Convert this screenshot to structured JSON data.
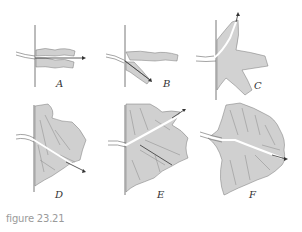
{
  "figure": {
    "caption": "figure 23.21",
    "panels": [
      {
        "id": "A",
        "label": "A"
      },
      {
        "id": "B",
        "label": "B"
      },
      {
        "id": "C",
        "label": "C"
      },
      {
        "id": "D",
        "label": "D"
      },
      {
        "id": "E",
        "label": "E"
      },
      {
        "id": "F",
        "label": "F"
      }
    ],
    "colors": {
      "fill": "#d4d4d4",
      "line": "#555555",
      "channel": "#ffffff"
    }
  }
}
